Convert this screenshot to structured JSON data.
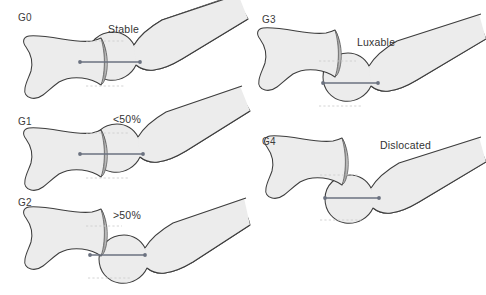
{
  "figure": {
    "panel_count": 5,
    "background_color": "#ffffff",
    "bone_fill": "#ececec",
    "bone_stroke": "#3d3d3d",
    "rim_fill": "#b0b0b0",
    "measure_line_color": "#6b7280",
    "guide_line_color": "#cfcfcf",
    "text_color": "#3b3b3b"
  },
  "panels": [
    {
      "id": "g0",
      "grade_label": "G0",
      "status_label": "Stable",
      "grade_pos": {
        "x": 18,
        "y": 12
      },
      "status_pos": {
        "x": 108,
        "y": 23
      },
      "origin": {
        "x": 0,
        "y": 0
      },
      "coverage_description": "Femoral head fully seated in acetabulum",
      "measure_line": {
        "x1": 79,
        "y1": 62,
        "x2": 141,
        "y2": 62
      },
      "guides": [
        {
          "x1": 86,
          "y1": 41,
          "x2": 123,
          "y2": 41
        },
        {
          "x1": 86,
          "y1": 86,
          "x2": 123,
          "y2": 86
        }
      ]
    },
    {
      "id": "g1",
      "grade_label": "G1",
      "status_label": "<50%",
      "grade_pos": {
        "x": 18,
        "y": 116
      },
      "status_pos": {
        "x": 113,
        "y": 114
      },
      "origin": {
        "x": 0,
        "y": 88
      },
      "coverage_description": "Less than fifty percent subluxation",
      "measure_line": {
        "x1": 79,
        "y1": 154,
        "x2": 141,
        "y2": 154
      },
      "guides": [
        {
          "x1": 86,
          "y1": 133,
          "x2": 123,
          "y2": 133
        },
        {
          "x1": 86,
          "y1": 178,
          "x2": 123,
          "y2": 178
        }
      ]
    },
    {
      "id": "g2",
      "grade_label": "G2",
      "status_label": ">50%",
      "grade_pos": {
        "x": 18,
        "y": 197
      },
      "status_pos": {
        "x": 113,
        "y": 210
      },
      "origin": {
        "x": 0,
        "y": 168
      },
      "coverage_description": "More than fifty percent subluxation",
      "measure_line": {
        "x1": 90,
        "y1": 255,
        "x2": 143,
        "y2": 255
      },
      "guides": [
        {
          "x1": 86,
          "y1": 226,
          "x2": 120,
          "y2": 226
        },
        {
          "x1": 88,
          "y1": 278,
          "x2": 127,
          "y2": 278
        }
      ]
    },
    {
      "id": "g3",
      "grade_label": "G3",
      "status_label": "Luxable",
      "grade_pos": {
        "x": 262,
        "y": 14
      },
      "status_pos": {
        "x": 357,
        "y": 36
      },
      "origin": {
        "x": 243,
        "y": 0
      },
      "coverage_description": "Femoral head luxable from acetabulum",
      "measure_line": {
        "x1": 323,
        "y1": 83,
        "x2": 377,
        "y2": 83
      },
      "guides": [
        {
          "x1": 318,
          "y1": 61,
          "x2": 353,
          "y2": 61
        },
        {
          "x1": 318,
          "y1": 105,
          "x2": 357,
          "y2": 105
        }
      ]
    },
    {
      "id": "g4",
      "grade_label": "G4",
      "status_label": "Dislocated",
      "grade_pos": {
        "x": 262,
        "y": 136
      },
      "status_pos": {
        "x": 380,
        "y": 139
      },
      "origin": {
        "x": 243,
        "y": 120
      },
      "coverage_description": "Femoral head fully dislocated",
      "measure_line": {
        "x1": 325,
        "y1": 198,
        "x2": 378,
        "y2": 198
      },
      "guides": [
        {
          "x1": 320,
          "y1": 175,
          "x2": 357,
          "y2": 175
        },
        {
          "x1": 320,
          "y1": 220,
          "x2": 360,
          "y2": 220
        }
      ]
    }
  ],
  "geometry": {
    "pelvis_path": "M 6 34 C 4 28 6 22 12 21 C 20 20 30 22 42 24 C 56 26 68 28 78 27 C 86 26 92 24 96 22 L 99 22 C 101 30 102 42 101 52 C 100 62 98 70 96 74 L 92 74 C 88 70 80 66 72 64 C 62 62 54 62 46 66 C 38 70 32 76 28 80 C 24 84 20 86 16 86 C 10 86 6 82 6 76 C 6 70 8 64 10 58 C 12 50 10 42 6 34 Z",
    "rim_path": "M 96 22 C 101 30 103 44 102 56 C 101 66 99 71 96 74 C 100 66 101 54 100 44 C 99 34 98 27 96 22 Z",
    "femur_head_path": "M 36 8 C 22 10 12 22 12 38 C 12 54 24 66 40 66 C 48 66 55 63 60 57 C 64 62 68 66 74 68 C 82 70 92 68 104 62 L 176 24 L 176 12 L 104 44 C 92 49 82 50 76 47 C 70 44 66 38 65 30 C 63 16 52 6 36 8 Z",
    "femur_shaft_top": "M 66 26 L 178 -14",
    "note": "paths are in local panel coordinates, scaled per panel"
  }
}
